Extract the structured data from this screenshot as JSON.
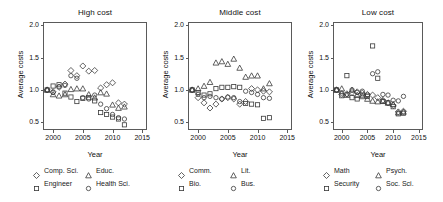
{
  "figure": {
    "width": 443,
    "height": 202,
    "background": "#ffffff",
    "stroke_color": "#3a3a3a",
    "frame_color": "#5a5a5a"
  },
  "chart_data": {
    "type": "scatter",
    "title": "",
    "panels": [
      {
        "title": "High cost",
        "xlabel": "Year",
        "ylabel": "Average costs",
        "xlim": [
          1998.3,
          2015.8
        ],
        "ylim": [
          0.38,
          2.05
        ],
        "xticks": [
          2000,
          2005,
          2010,
          2015
        ],
        "yticks": [
          0.5,
          1.0,
          1.5,
          2.0
        ],
        "ytick_labels": [
          "0.5",
          "1.0",
          "1.5",
          "2.0"
        ],
        "xtick_labels": [
          "2000",
          "2005",
          "2010",
          "2015"
        ],
        "grid": false,
        "legend_position": "below",
        "series": [
          {
            "name": "Comp. Sci.",
            "marker": "diamond",
            "points": [
              [
                1999,
                1.0
              ],
              [
                2000,
                0.97
              ],
              [
                2001,
                1.04
              ],
              [
                2002,
                1.09
              ],
              [
                2003,
                1.3
              ],
              [
                2004,
                1.22
              ],
              [
                2005,
                1.37
              ],
              [
                2006,
                1.29
              ],
              [
                2007,
                1.3
              ],
              [
                2008,
                1.03
              ],
              [
                2009,
                1.08
              ],
              [
                2010,
                1.11
              ],
              [
                2011,
                0.8
              ],
              [
                2012,
                0.78
              ]
            ]
          },
          {
            "name": "Educ.",
            "marker": "triangle",
            "points": [
              [
                1999,
                1.0
              ],
              [
                2000,
                0.93
              ],
              [
                2001,
                0.91
              ],
              [
                2002,
                0.93
              ],
              [
                2003,
                1.01
              ],
              [
                2004,
                1.02
              ],
              [
                2005,
                1.02
              ],
              [
                2006,
                0.93
              ],
              [
                2007,
                0.88
              ],
              [
                2008,
                0.96
              ],
              [
                2009,
                0.94
              ],
              [
                2010,
                0.77
              ],
              [
                2011,
                0.72
              ],
              [
                2012,
                0.74
              ]
            ]
          },
          {
            "name": "Engineer",
            "marker": "square",
            "points": [
              [
                1999,
                1.0
              ],
              [
                2000,
                1.06
              ],
              [
                2001,
                1.08
              ],
              [
                2002,
                0.95
              ],
              [
                2003,
                0.89
              ],
              [
                2004,
                0.82
              ],
              [
                2005,
                0.87
              ],
              [
                2006,
                0.88
              ],
              [
                2007,
                0.83
              ],
              [
                2008,
                0.65
              ],
              [
                2009,
                0.62
              ],
              [
                2010,
                0.58
              ],
              [
                2011,
                0.55
              ],
              [
                2012,
                0.46
              ]
            ]
          },
          {
            "name": "Health Sci.",
            "marker": "circle",
            "points": [
              [
                1999,
                1.0
              ],
              [
                2000,
                0.96
              ],
              [
                2001,
                1.05
              ],
              [
                2002,
                1.07
              ],
              [
                2003,
                1.22
              ],
              [
                2004,
                1.18
              ],
              [
                2005,
                0.88
              ],
              [
                2006,
                0.86
              ],
              [
                2007,
                0.92
              ],
              [
                2008,
                0.78
              ],
              [
                2009,
                0.71
              ],
              [
                2010,
                0.62
              ],
              [
                2011,
                0.57
              ],
              [
                2012,
                0.55
              ]
            ]
          }
        ]
      },
      {
        "title": "Middle cost",
        "xlabel": "Year",
        "ylabel": "Average costs",
        "xlim": [
          1998.3,
          2015.8
        ],
        "ylim": [
          0.38,
          2.05
        ],
        "xticks": [
          2000,
          2005,
          2010,
          2015
        ],
        "yticks": [
          0.5,
          1.0,
          1.5,
          2.0
        ],
        "ytick_labels": [
          "0.5",
          "1.0",
          "1.5",
          "2.0"
        ],
        "xtick_labels": [
          "2000",
          "2005",
          "2010",
          "2015"
        ],
        "grid": false,
        "legend_position": "below",
        "series": [
          {
            "name": "Comm.",
            "marker": "diamond",
            "points": [
              [
                1999,
                1.0
              ],
              [
                2000,
                0.88
              ],
              [
                2001,
                0.8
              ],
              [
                2002,
                0.72
              ],
              [
                2003,
                0.78
              ],
              [
                2004,
                0.86
              ],
              [
                2005,
                0.88
              ],
              [
                2006,
                0.86
              ],
              [
                2007,
                0.78
              ],
              [
                2008,
                0.82
              ],
              [
                2009,
                1.02
              ],
              [
                2010,
                1.0
              ],
              [
                2011,
                0.98
              ],
              [
                2012,
                0.97
              ]
            ]
          },
          {
            "name": "Lit.",
            "marker": "triangle",
            "points": [
              [
                1999,
                1.0
              ],
              [
                2000,
                1.02
              ],
              [
                2001,
                1.06
              ],
              [
                2002,
                1.12
              ],
              [
                2003,
                1.42
              ],
              [
                2004,
                1.44
              ],
              [
                2005,
                1.4
              ],
              [
                2006,
                1.48
              ],
              [
                2007,
                1.34
              ],
              [
                2008,
                1.2
              ],
              [
                2009,
                1.22
              ],
              [
                2010,
                1.22
              ],
              [
                2011,
                1.02
              ],
              [
                2012,
                1.1
              ]
            ]
          },
          {
            "name": "Bio.",
            "marker": "square",
            "points": [
              [
                1999,
                1.0
              ],
              [
                2000,
                0.96
              ],
              [
                2001,
                0.92
              ],
              [
                2002,
                0.94
              ],
              [
                2003,
                1.02
              ],
              [
                2004,
                1.04
              ],
              [
                2005,
                1.04
              ],
              [
                2006,
                1.05
              ],
              [
                2007,
                1.04
              ],
              [
                2008,
                0.79
              ],
              [
                2009,
                0.78
              ],
              [
                2010,
                0.77
              ],
              [
                2011,
                0.56
              ],
              [
                2012,
                0.57
              ]
            ]
          },
          {
            "name": "Bus.",
            "marker": "circle",
            "points": [
              [
                1999,
                1.0
              ],
              [
                2000,
                0.93
              ],
              [
                2001,
                0.88
              ],
              [
                2002,
                0.9
              ],
              [
                2003,
                0.88
              ],
              [
                2004,
                0.86
              ],
              [
                2005,
                0.89
              ],
              [
                2006,
                0.88
              ],
              [
                2007,
                0.82
              ],
              [
                2008,
                0.98
              ],
              [
                2009,
                0.96
              ],
              [
                2010,
                0.93
              ],
              [
                2011,
                0.88
              ],
              [
                2012,
                0.87
              ]
            ]
          }
        ]
      },
      {
        "title": "Low cost",
        "xlabel": "Year",
        "ylabel": "Average costs",
        "xlim": [
          1998.3,
          2015.8
        ],
        "ylim": [
          0.38,
          2.05
        ],
        "xticks": [
          2000,
          2005,
          2010,
          2015
        ],
        "yticks": [
          0.5,
          1.0,
          1.5,
          2.0
        ],
        "ytick_labels": [
          "0.5",
          "1.0",
          "1.5",
          "2.0"
        ],
        "xtick_labels": [
          "2000",
          "2005",
          "2010",
          "2015"
        ],
        "grid": false,
        "legend_position": "below",
        "series": [
          {
            "name": "Math",
            "marker": "diamond",
            "points": [
              [
                1999,
                1.0
              ],
              [
                2000,
                0.93
              ],
              [
                2001,
                0.94
              ],
              [
                2002,
                0.96
              ],
              [
                2003,
                0.97
              ],
              [
                2004,
                0.95
              ],
              [
                2005,
                0.93
              ],
              [
                2006,
                0.92
              ],
              [
                2007,
                0.88
              ],
              [
                2008,
                0.84
              ],
              [
                2009,
                0.8
              ],
              [
                2010,
                0.76
              ],
              [
                2011,
                0.66
              ],
              [
                2012,
                0.67
              ]
            ]
          },
          {
            "name": "Psych.",
            "marker": "triangle",
            "points": [
              [
                1999,
                1.0
              ],
              [
                2000,
                1.02
              ],
              [
                2001,
                0.92
              ],
              [
                2002,
                1.0
              ],
              [
                2003,
                0.92
              ],
              [
                2004,
                0.9
              ],
              [
                2005,
                0.86
              ],
              [
                2006,
                0.83
              ],
              [
                2007,
                0.82
              ],
              [
                2008,
                0.83
              ],
              [
                2009,
                0.8
              ],
              [
                2010,
                0.78
              ],
              [
                2011,
                0.65
              ],
              [
                2012,
                0.66
              ]
            ]
          },
          {
            "name": "Security",
            "marker": "square",
            "points": [
              [
                1999,
                1.0
              ],
              [
                2000,
                0.91
              ],
              [
                2001,
                1.22
              ],
              [
                2002,
                0.88
              ],
              [
                2003,
                0.86
              ],
              [
                2004,
                0.92
              ],
              [
                2005,
                0.9
              ],
              [
                2006,
                1.68
              ],
              [
                2007,
                1.18
              ],
              [
                2008,
                0.82
              ],
              [
                2009,
                0.8
              ],
              [
                2010,
                0.74
              ],
              [
                2011,
                0.63
              ],
              [
                2012,
                0.64
              ]
            ]
          },
          {
            "name": "Soc. Sci.",
            "marker": "circle",
            "points": [
              [
                1999,
                1.0
              ],
              [
                2000,
                0.95
              ],
              [
                2001,
                0.93
              ],
              [
                2002,
                1.0
              ],
              [
                2003,
                0.96
              ],
              [
                2004,
                0.98
              ],
              [
                2005,
                0.92
              ],
              [
                2006,
                1.25
              ],
              [
                2007,
                1.28
              ],
              [
                2008,
                0.93
              ],
              [
                2009,
                0.92
              ],
              [
                2010,
                0.84
              ],
              [
                2011,
                0.83
              ],
              [
                2012,
                0.9
              ]
            ]
          }
        ]
      }
    ]
  }
}
